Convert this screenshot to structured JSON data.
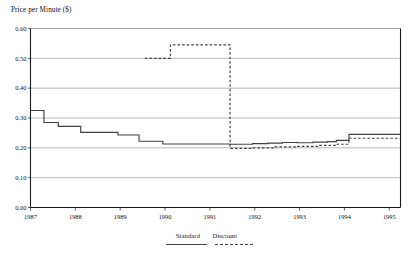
{
  "chart_data": {
    "type": "line",
    "title": "Price per Minute ($)",
    "xlabel": "",
    "ylabel": "Price per Minute ($)",
    "xlim": [
      1987,
      1995.25
    ],
    "ylim": [
      0.0,
      0.6
    ],
    "ytick_labels": [
      "0.00",
      "0.10",
      "0.20",
      "0.30",
      "0.40",
      "0.50",
      "0.60"
    ],
    "ytick_values": [
      0.0,
      0.1,
      0.2,
      0.3,
      0.4,
      0.5,
      0.6
    ],
    "xtick_labels": [
      "1987",
      "1988",
      "1989",
      "1990",
      "1991",
      "1992",
      "1993",
      "1994",
      "1995"
    ],
    "xtick_values": [
      1987,
      1988,
      1989,
      1990,
      1991,
      1992,
      1993,
      1994,
      1995
    ],
    "grid": "horizontal",
    "legend_position": "bottom-center",
    "drawstyle": "steps-post",
    "series": [
      {
        "name": "Standard",
        "style": "solid",
        "color": "#404040",
        "x": [
          1987.0,
          1987.3,
          1987.62,
          1988.12,
          1988.95,
          1989.42,
          1989.95,
          1991.45,
          1991.95,
          1992.3,
          1992.62,
          1992.95,
          1993.3,
          1993.62,
          1993.82,
          1994.1,
          1995.25
        ],
        "y": [
          0.325,
          0.285,
          0.272,
          0.252,
          0.243,
          0.222,
          0.213,
          0.212,
          0.214,
          0.216,
          0.218,
          0.217,
          0.219,
          0.221,
          0.225,
          0.245,
          0.245
        ]
      },
      {
        "name": "Discount",
        "style": "dashed",
        "color": "#404040",
        "x": [
          1989.55,
          1990.12,
          1991.45,
          1991.95,
          1992.45,
          1992.95,
          1993.45,
          1993.82,
          1994.1,
          1995.25
        ],
        "y": [
          0.5,
          0.545,
          0.198,
          0.2,
          0.203,
          0.205,
          0.208,
          0.212,
          0.232,
          0.232
        ]
      }
    ],
    "annotations": []
  },
  "legend": {
    "standard_label": "Standard",
    "discount_label": "Discount"
  },
  "colors": {
    "axis": "#1a1a1a",
    "grid": "#9a9a9a",
    "line": "#404040",
    "background": "#ffffff"
  }
}
